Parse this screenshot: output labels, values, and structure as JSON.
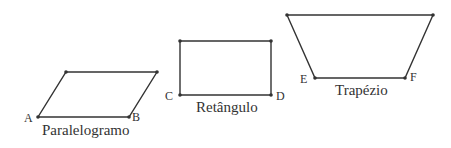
{
  "colors": {
    "stroke": "#333333",
    "text": "#333333",
    "background": "#ffffff"
  },
  "shapes": [
    {
      "name": "Paralelogramo",
      "points": [
        [
          38,
          117
        ],
        [
          129,
          117
        ],
        [
          157,
          72
        ],
        [
          66,
          72
        ]
      ],
      "vertex_labels": [
        {
          "text": "A",
          "x": 24,
          "y": 111
        },
        {
          "text": "B",
          "x": 132,
          "y": 110
        }
      ],
      "caption": {
        "text": "Paralelogramo",
        "x": 42,
        "y": 122
      }
    },
    {
      "name": "Retângulo",
      "points": [
        [
          180,
          41
        ],
        [
          271,
          41
        ],
        [
          271,
          95
        ],
        [
          180,
          95
        ]
      ],
      "vertex_labels": [
        {
          "text": "C",
          "x": 165,
          "y": 89
        },
        {
          "text": "D",
          "x": 276,
          "y": 89
        }
      ],
      "caption": {
        "text": "Retângulo",
        "x": 196,
        "y": 99
      }
    },
    {
      "name": "Trapézio",
      "points": [
        [
          287,
          15
        ],
        [
          433,
          15
        ],
        [
          405,
          78
        ],
        [
          315,
          78
        ]
      ],
      "vertex_labels": [
        {
          "text": "E",
          "x": 300,
          "y": 72
        },
        {
          "text": "F",
          "x": 410,
          "y": 70
        }
      ],
      "caption": {
        "text": "Trapézio",
        "x": 335,
        "y": 82
      }
    }
  ]
}
